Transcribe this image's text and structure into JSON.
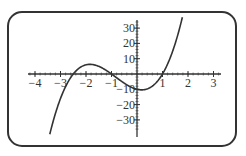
{
  "chart_data": {
    "type": "line",
    "title": "",
    "xlabel": "",
    "ylabel": "",
    "function": "f(x) = 4x^3 + 10x^2 - 4x - 10",
    "xlim": [
      -4.3,
      3.3
    ],
    "ylim": [
      -38,
      36
    ],
    "x_ticks": [
      -4,
      -3,
      -2,
      -1,
      1,
      2,
      3
    ],
    "x_tick_labels": [
      "−4",
      "−3",
      "−2",
      "−1",
      "1",
      "2",
      "3"
    ],
    "y_ticks": [
      30,
      20,
      10,
      -10,
      -20,
      -30
    ],
    "y_tick_labels": [
      "30",
      "20",
      "10",
      "−10",
      "−20",
      "−30"
    ],
    "grid": false,
    "legend": null,
    "series": [
      {
        "name": "f(x)",
        "x": [
          -3.4,
          -3.0,
          -2.5,
          -2.0,
          -1.9,
          -1.5,
          -1.0,
          -0.5,
          0.0,
          0.3,
          0.5,
          1.0,
          1.5,
          1.8
        ],
        "values": [
          -37.9,
          -16.0,
          0.0,
          6.0,
          6.1,
          3.5,
          0.0,
          -5.0,
          -10.0,
          -10.2,
          -9.0,
          0.0,
          17.5,
          38.5
        ]
      }
    ],
    "roots": [
      -2.5,
      -1,
      1
    ],
    "local_max": {
      "x": -1.9,
      "y": 6
    },
    "local_min": {
      "x": 0.27,
      "y": -10.3
    }
  },
  "colors": {
    "curve": "#333333",
    "axis": "#333333",
    "frame": "#333333",
    "background": "#ffffff"
  }
}
